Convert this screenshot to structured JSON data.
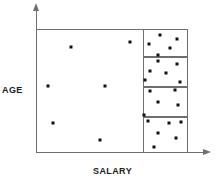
{
  "figure": {
    "name": "scatter-plot-age-vs-salary",
    "background_color": "#ffffff",
    "axis_color": "#6f6f6f",
    "point_color": "#101010"
  },
  "axes": {
    "y_label": "AGE",
    "x_label": "SALARY"
  },
  "chart_data": {
    "type": "scatter",
    "title": "",
    "xlabel": "SALARY",
    "ylabel": "AGE",
    "xlim": [
      0,
      100
    ],
    "ylim": [
      0,
      100
    ],
    "grid": false,
    "legend": null,
    "axis_arrows": true,
    "plot_frame": {
      "x": 0,
      "y": 0,
      "width": 100,
      "height": 100
    },
    "annotations": [
      {
        "name": "cluster-box-1",
        "x": 70.5,
        "y": 77.5,
        "width": 29.5,
        "height": 22.5,
        "point_count": 5
      },
      {
        "name": "cluster-box-2",
        "x": 70.5,
        "y": 53.0,
        "width": 29.5,
        "height": 24.5,
        "point_count": 6
      },
      {
        "name": "cluster-box-3",
        "x": 70.5,
        "y": 29.0,
        "width": 29.5,
        "height": 24.0,
        "point_count": 5
      },
      {
        "name": "cluster-box-4",
        "x": 70.5,
        "y": 0,
        "width": 29.5,
        "height": 29.0,
        "point_count": 6
      }
    ],
    "series": [
      {
        "name": "sparse-region-points",
        "region": "left",
        "points": [
          {
            "x": 23.0,
            "y": 85.5
          },
          {
            "x": 62.0,
            "y": 89.5
          },
          {
            "x": 8.0,
            "y": 54.0
          },
          {
            "x": 45.5,
            "y": 54.0
          },
          {
            "x": 11.5,
            "y": 24.5
          },
          {
            "x": 42.0,
            "y": 10.5
          }
        ]
      },
      {
        "name": "cluster-1-points",
        "region": "box-1",
        "points": [
          {
            "x": 81.5,
            "y": 95.5
          },
          {
            "x": 93.0,
            "y": 92.0
          },
          {
            "x": 74.5,
            "y": 88.0
          },
          {
            "x": 88.0,
            "y": 85.0
          },
          {
            "x": 80.5,
            "y": 79.0
          }
        ]
      },
      {
        "name": "cluster-2-points",
        "region": "box-2",
        "points": [
          {
            "x": 80.0,
            "y": 74.5
          },
          {
            "x": 92.5,
            "y": 72.0
          },
          {
            "x": 75.0,
            "y": 66.0
          },
          {
            "x": 85.5,
            "y": 64.5
          },
          {
            "x": 71.5,
            "y": 58.5
          },
          {
            "x": 95.0,
            "y": 57.5
          }
        ]
      },
      {
        "name": "cluster-3-points",
        "region": "box-3",
        "points": [
          {
            "x": 75.0,
            "y": 50.0
          },
          {
            "x": 91.5,
            "y": 50.5
          },
          {
            "x": 80.5,
            "y": 41.0
          },
          {
            "x": 93.5,
            "y": 38.5
          },
          {
            "x": 71.0,
            "y": 31.0
          }
        ]
      },
      {
        "name": "cluster-4-points",
        "region": "box-4",
        "points": [
          {
            "x": 73.5,
            "y": 25.5
          },
          {
            "x": 87.5,
            "y": 24.0
          },
          {
            "x": 95.5,
            "y": 25.0
          },
          {
            "x": 80.0,
            "y": 16.5
          },
          {
            "x": 92.0,
            "y": 12.0
          },
          {
            "x": 77.5,
            "y": 5.0
          }
        ]
      }
    ]
  }
}
